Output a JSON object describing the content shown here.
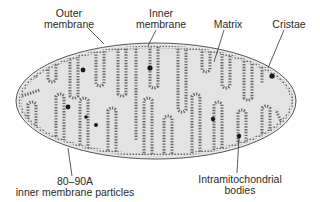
{
  "diagram": {
    "labels": {
      "outer_membrane": [
        "Outer",
        "membrane"
      ],
      "inner_membrane": [
        "Inner",
        "membrane"
      ],
      "matrix": "Matrix",
      "cristae": "Cristae",
      "particles": [
        "80–90A",
        "inner membrane particles"
      ],
      "bodies": [
        "Intramitochondrial",
        "bodies"
      ]
    },
    "colors": {
      "matrix_fill": "#e3e3e3",
      "membrane_stroke": "#555555",
      "particle": "#6a6a6a",
      "body": "#1a1a1a",
      "text": "#2a2a2a"
    }
  }
}
